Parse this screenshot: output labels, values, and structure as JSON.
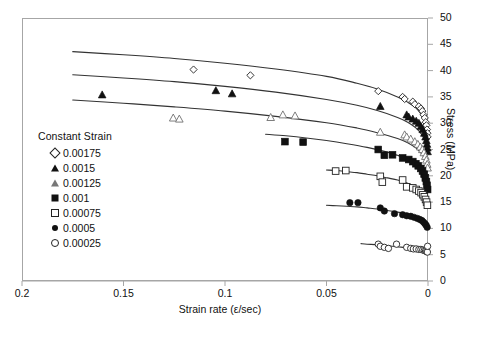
{
  "chart_data": {
    "type": "scatter",
    "title": "",
    "xlabel": "Strain rate (ε/sec)",
    "ylabel": "Stress (MPa)",
    "xlim": [
      0.2,
      0.0
    ],
    "ylim": [
      0,
      50
    ],
    "x_reversed": true,
    "xticks": [
      "0.2",
      "0.15",
      "0.1",
      "0.05",
      "0"
    ],
    "xtick_values": [
      0.2,
      0.15,
      0.1,
      0.05,
      0
    ],
    "yticks": [
      "0",
      "5",
      "10",
      "15",
      "20",
      "25",
      "30",
      "35",
      "40",
      "45",
      "50"
    ],
    "ytick_values": [
      0,
      5,
      10,
      15,
      20,
      25,
      30,
      35,
      40,
      45,
      50
    ],
    "y_axis_position": "right",
    "grid": false,
    "legend_title": "Constant Strain",
    "legend_position": "left-inside",
    "series": [
      {
        "name": "0.00175",
        "marker": "open-diamond",
        "points": [
          [
            0.1155,
            40.2
          ],
          [
            0.0875,
            39.1
          ],
          [
            0.0245,
            36.1
          ],
          [
            0.0125,
            35.0
          ],
          [
            0.0115,
            34.6
          ],
          [
            0.0075,
            34.1
          ],
          [
            0.0065,
            33.6
          ],
          [
            0.0045,
            33.2
          ],
          [
            0.0035,
            32.8
          ],
          [
            0.0028,
            32.3
          ],
          [
            0.0022,
            31.6
          ],
          [
            0.0016,
            31.0
          ],
          [
            0.0011,
            30.2
          ],
          [
            0.0008,
            29.6
          ],
          [
            0.0005,
            28.8
          ],
          [
            0.0003,
            28.1
          ],
          [
            0.0002,
            27.4
          ]
        ],
        "fit_curve": [
          [
            0.175,
            43.6
          ],
          [
            0.15,
            43.0
          ],
          [
            0.125,
            42.3
          ],
          [
            0.1,
            41.4
          ],
          [
            0.075,
            40.3
          ],
          [
            0.05,
            38.9
          ],
          [
            0.035,
            37.6
          ],
          [
            0.025,
            36.5
          ],
          [
            0.015,
            35.0
          ],
          [
            0.01,
            34.0
          ],
          [
            0.006,
            32.9
          ],
          [
            0.003,
            31.5
          ],
          [
            0.0015,
            30.3
          ],
          [
            0.0006,
            28.9
          ],
          [
            0.0002,
            27.6
          ]
        ]
      },
      {
        "name": "0.0015",
        "marker": "filled-triangle",
        "points": [
          [
            0.1605,
            35.4
          ],
          [
            0.1045,
            36.2
          ],
          [
            0.0965,
            35.6
          ],
          [
            0.0235,
            33.2
          ],
          [
            0.0105,
            31.6
          ],
          [
            0.0095,
            31.2
          ],
          [
            0.0075,
            30.8
          ],
          [
            0.0058,
            30.4
          ],
          [
            0.0045,
            30.0
          ],
          [
            0.0035,
            29.4
          ],
          [
            0.0026,
            28.8
          ],
          [
            0.0018,
            28.1
          ],
          [
            0.0012,
            27.4
          ],
          [
            0.0008,
            26.7
          ],
          [
            0.0005,
            26.0
          ],
          [
            0.0003,
            25.3
          ],
          [
            0.0002,
            24.6
          ]
        ],
        "fit_curve": [
          [
            0.175,
            39.2
          ],
          [
            0.15,
            38.6
          ],
          [
            0.125,
            37.9
          ],
          [
            0.1,
            37.0
          ],
          [
            0.075,
            35.9
          ],
          [
            0.05,
            34.5
          ],
          [
            0.035,
            33.4
          ],
          [
            0.025,
            32.4
          ],
          [
            0.015,
            31.1
          ],
          [
            0.01,
            30.2
          ],
          [
            0.006,
            29.1
          ],
          [
            0.003,
            27.8
          ],
          [
            0.0015,
            26.6
          ],
          [
            0.0006,
            25.3
          ],
          [
            0.0002,
            24.2
          ]
        ]
      },
      {
        "name": "0.00125",
        "marker": "open-triangle",
        "points": [
          [
            0.1255,
            31.0
          ],
          [
            0.1225,
            30.8
          ],
          [
            0.0775,
            31.1
          ],
          [
            0.0715,
            31.6
          ],
          [
            0.0655,
            31.4
          ],
          [
            0.0235,
            28.3
          ],
          [
            0.0115,
            27.8
          ],
          [
            0.0105,
            27.4
          ],
          [
            0.0085,
            27.0
          ],
          [
            0.0065,
            26.5
          ],
          [
            0.005,
            26.0
          ],
          [
            0.0038,
            25.5
          ],
          [
            0.0028,
            25.0
          ],
          [
            0.002,
            24.4
          ],
          [
            0.0013,
            23.7
          ],
          [
            0.0008,
            23.0
          ],
          [
            0.0004,
            22.2
          ],
          [
            0.0002,
            21.5
          ]
        ],
        "fit_curve": [
          [
            0.175,
            34.4
          ],
          [
            0.15,
            33.8
          ],
          [
            0.125,
            33.1
          ],
          [
            0.1,
            32.3
          ],
          [
            0.075,
            31.3
          ],
          [
            0.05,
            30.1
          ],
          [
            0.035,
            29.1
          ],
          [
            0.025,
            28.2
          ],
          [
            0.015,
            27.1
          ],
          [
            0.01,
            26.3
          ],
          [
            0.006,
            25.3
          ],
          [
            0.003,
            24.1
          ],
          [
            0.0015,
            23.0
          ],
          [
            0.0006,
            21.9
          ],
          [
            0.0002,
            20.9
          ]
        ]
      },
      {
        "name": "0.001",
        "marker": "filled-square",
        "points": [
          [
            0.0705,
            26.5
          ],
          [
            0.0615,
            26.4
          ],
          [
            0.0245,
            25.0
          ],
          [
            0.0215,
            23.9
          ],
          [
            0.0175,
            24.0
          ],
          [
            0.0125,
            23.4
          ],
          [
            0.0095,
            23.1
          ],
          [
            0.0075,
            22.7
          ],
          [
            0.006,
            22.3
          ],
          [
            0.0048,
            21.9
          ],
          [
            0.0036,
            21.4
          ],
          [
            0.0027,
            20.9
          ],
          [
            0.0019,
            20.3
          ],
          [
            0.0013,
            19.6
          ],
          [
            0.0008,
            18.9
          ],
          [
            0.0005,
            18.2
          ],
          [
            0.0002,
            17.4
          ]
        ],
        "fit_curve": [
          [
            0.08,
            27.9
          ],
          [
            0.07,
            27.6
          ],
          [
            0.06,
            27.2
          ],
          [
            0.05,
            26.7
          ],
          [
            0.04,
            26.1
          ],
          [
            0.03,
            25.4
          ],
          [
            0.02,
            24.5
          ],
          [
            0.015,
            23.9
          ],
          [
            0.01,
            23.2
          ],
          [
            0.006,
            22.4
          ],
          [
            0.003,
            21.3
          ],
          [
            0.0015,
            20.3
          ],
          [
            0.0006,
            19.2
          ],
          [
            0.0002,
            18.2
          ]
        ]
      },
      {
        "name": "0.00075",
        "marker": "open-square",
        "points": [
          [
            0.0455,
            20.9
          ],
          [
            0.0405,
            21.0
          ],
          [
            0.0235,
            19.9
          ],
          [
            0.0225,
            18.8
          ],
          [
            0.0125,
            19.2
          ],
          [
            0.0105,
            17.9
          ],
          [
            0.0075,
            17.7
          ],
          [
            0.0058,
            17.4
          ],
          [
            0.0045,
            17.1
          ],
          [
            0.0034,
            16.8
          ],
          [
            0.0025,
            16.4
          ],
          [
            0.0018,
            16.0
          ],
          [
            0.0012,
            15.5
          ],
          [
            0.0007,
            15.0
          ],
          [
            0.0003,
            14.4
          ]
        ],
        "fit_curve": [
          [
            0.05,
            21.1
          ],
          [
            0.045,
            21.0
          ],
          [
            0.04,
            20.8
          ],
          [
            0.035,
            20.6
          ],
          [
            0.03,
            20.3
          ],
          [
            0.025,
            20.0
          ],
          [
            0.02,
            19.6
          ],
          [
            0.015,
            19.2
          ],
          [
            0.01,
            18.6
          ],
          [
            0.006,
            17.9
          ],
          [
            0.003,
            17.0
          ],
          [
            0.0015,
            16.2
          ],
          [
            0.0006,
            15.3
          ],
          [
            0.0002,
            14.5
          ]
        ]
      },
      {
        "name": "0.0005",
        "marker": "filled-circle",
        "points": [
          [
            0.0385,
            14.9
          ],
          [
            0.0345,
            14.9
          ],
          [
            0.0235,
            13.9
          ],
          [
            0.0215,
            13.3
          ],
          [
            0.0165,
            12.8
          ],
          [
            0.0125,
            12.6
          ],
          [
            0.0105,
            12.4
          ],
          [
            0.0085,
            12.3
          ],
          [
            0.0068,
            12.1
          ],
          [
            0.0052,
            11.9
          ],
          [
            0.004,
            11.7
          ],
          [
            0.003,
            11.5
          ],
          [
            0.0022,
            11.2
          ],
          [
            0.0015,
            10.9
          ],
          [
            0.0009,
            10.6
          ],
          [
            0.0004,
            10.2
          ]
        ],
        "fit_curve": [
          [
            0.05,
            14.4
          ],
          [
            0.045,
            14.3
          ],
          [
            0.04,
            14.2
          ],
          [
            0.035,
            14.1
          ],
          [
            0.03,
            13.9
          ],
          [
            0.025,
            13.7
          ],
          [
            0.02,
            13.4
          ],
          [
            0.015,
            13.1
          ],
          [
            0.01,
            12.7
          ],
          [
            0.006,
            12.2
          ],
          [
            0.003,
            11.6
          ],
          [
            0.0015,
            11.1
          ],
          [
            0.0006,
            10.6
          ],
          [
            0.0002,
            10.1
          ]
        ]
      },
      {
        "name": "0.00025",
        "marker": "open-circle",
        "points": [
          [
            0.0245,
            7.0
          ],
          [
            0.0235,
            6.6
          ],
          [
            0.0215,
            6.4
          ],
          [
            0.0195,
            6.2
          ],
          [
            0.0155,
            7.0
          ],
          [
            0.0105,
            6.4
          ],
          [
            0.0085,
            6.2
          ],
          [
            0.0072,
            6.1
          ],
          [
            0.0058,
            6.1
          ],
          [
            0.0045,
            6.0
          ],
          [
            0.0035,
            6.0
          ],
          [
            0.0026,
            5.9
          ],
          [
            0.0018,
            5.8
          ],
          [
            0.0012,
            5.7
          ],
          [
            0.0007,
            5.6
          ],
          [
            0.0003,
            5.5
          ],
          [
            0.0002,
            6.6
          ]
        ],
        "fit_curve": [
          [
            0.033,
            7.1
          ],
          [
            0.03,
            7.0
          ],
          [
            0.025,
            6.9
          ],
          [
            0.02,
            6.7
          ],
          [
            0.015,
            6.5
          ],
          [
            0.01,
            6.3
          ],
          [
            0.006,
            6.1
          ],
          [
            0.003,
            5.8
          ],
          [
            0.0015,
            5.6
          ],
          [
            0.0006,
            5.4
          ],
          [
            0.0002,
            5.3
          ]
        ]
      }
    ]
  },
  "legend": {
    "title": "Constant Strain",
    "items": [
      {
        "label": "0.00175",
        "marker": "open-diamond"
      },
      {
        "label": "0.0015",
        "marker": "filled-triangle"
      },
      {
        "label": "0.00125",
        "marker": "open-triangle"
      },
      {
        "label": "0.001",
        "marker": "filled-square"
      },
      {
        "label": "0.00075",
        "marker": "open-square"
      },
      {
        "label": "0.0005",
        "marker": "filled-circle"
      },
      {
        "label": "0.00025",
        "marker": "open-circle"
      }
    ]
  },
  "caption": {
    "text": ""
  },
  "colors": {
    "background": "#ffffff",
    "frame": "#a6a6a6",
    "marker_fill": "#111111",
    "marker_edge": "#222222",
    "curve": "#333333",
    "text": "#111111"
  }
}
